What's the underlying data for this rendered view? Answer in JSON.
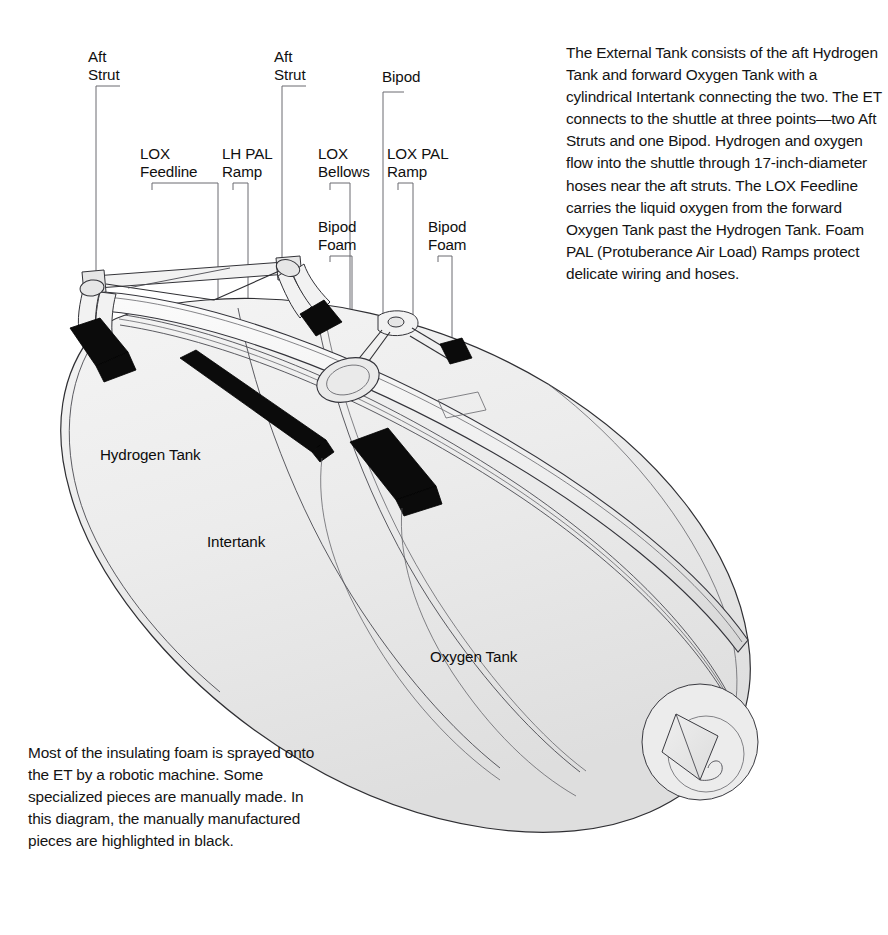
{
  "document": {
    "title": "Space Shuttle External Tank",
    "subject": "External Tank cutaway illustration with foam insulation callouts"
  },
  "intro_paragraph": "The External Tank consists of the aft Hydrogen Tank and forward Oxygen Tank with a cylindrical Intertank connecting the two. The ET connects to the shuttle at three points—two Aft Struts and one Bipod. Hydrogen and oxygen flow into the shuttle through 17-inch-diameter hoses near the aft struts. The LOX Feedline carries the liquid oxygen from the forward Oxygen Tank past the Hydrogen Tank. Foam PAL (Protuberance Air Load) Ramps protect delicate wiring and hoses.",
  "foam_note_paragraph": "Most of the insulating foam is sprayed onto the ET by a robotic machine. Some specialized pieces are manually made. In this diagram, the manually manufactured pieces are highlighted in black.",
  "callouts": [
    {
      "id": "aft-strut-left",
      "label": "Aft\nStrut",
      "x": 88,
      "y": 48,
      "leader_x": 96,
      "leader_top": 86,
      "leader_bottom": 286,
      "elbow_x": 120
    },
    {
      "id": "lox-feedline",
      "label": "LOX\nFeedline",
      "x": 140,
      "y": 145,
      "leader_x": 218,
      "leader_top": 183,
      "leader_bottom": 330,
      "elbow_x": 151
    },
    {
      "id": "lh-pal-ramp",
      "label": "LH PAL\nRamp",
      "x": 222,
      "y": 145,
      "leader_x": 248,
      "leader_top": 183,
      "leader_bottom": 370,
      "elbow_x": 233
    },
    {
      "id": "aft-strut-right",
      "label": "Aft\nStrut",
      "x": 274,
      "y": 48,
      "leader_x": 282,
      "leader_top": 86,
      "leader_bottom": 276,
      "elbow_x": 306
    },
    {
      "id": "lox-bellows",
      "label": "LOX\nBellows",
      "x": 318,
      "y": 145,
      "leader_x": 350,
      "leader_top": 183,
      "leader_bottom": 370,
      "elbow_x": 329
    },
    {
      "id": "bipod",
      "label": "Bipod",
      "x": 382,
      "y": 68,
      "leader_x": 383,
      "leader_top": 92,
      "leader_bottom": 320,
      "elbow_x": 395
    },
    {
      "id": "lox-pal-ramp",
      "label": "LOX PAL\nRamp",
      "x": 387,
      "y": 145,
      "leader_x": 413,
      "leader_top": 183,
      "leader_bottom": 395,
      "elbow_x": 398
    },
    {
      "id": "bipod-foam-left",
      "label": "Bipod\nFoam",
      "x": 318,
      "y": 218,
      "leader_x": 352,
      "leader_top": 256,
      "leader_bottom": 374,
      "elbow_x": 329
    },
    {
      "id": "bipod-foam-right",
      "label": "Bipod\nFoam",
      "x": 428,
      "y": 218,
      "leader_x": 452,
      "leader_top": 256,
      "leader_bottom": 352,
      "elbow_x": 439
    }
  ],
  "part_labels": [
    {
      "id": "hydrogen-tank",
      "label": "Hydrogen Tank",
      "x": 100,
      "y": 446
    },
    {
      "id": "intertank",
      "label": "Intertank",
      "x": 207,
      "y": 533
    },
    {
      "id": "oxygen-tank",
      "label": "Oxygen Tank",
      "x": 430,
      "y": 648
    }
  ],
  "legend": {
    "black_means": "manually manufactured pieces highlighted in black"
  },
  "colors": {
    "ink": "#2f2f33",
    "leader": "#6a6a70",
    "black_foam": "#0b0b0b",
    "body_light": "#f0f0f0",
    "body_mid": "#e2e2e2",
    "background": "#ffffff",
    "text": "#141414"
  }
}
